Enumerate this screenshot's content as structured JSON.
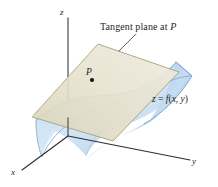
{
  "figure": {
    "background_color": "#ffffff"
  },
  "labels": {
    "z_axis": "z",
    "x_axis": "x",
    "y_axis": "y",
    "point": "P",
    "tangent_plane_text": "Tangent plane at ",
    "tangent_plane_point": "P",
    "surface_equation_lhs": "z",
    "surface_equation_eq": " = ",
    "surface_equation_fn": "f",
    "surface_equation_open": "(",
    "surface_equation_x": "x",
    "surface_equation_comma": ", ",
    "surface_equation_y": "y",
    "surface_equation_close": ")"
  },
  "colors": {
    "axis": "#6e6e72",
    "axis_dark": "#2f2f33",
    "plane_fill": "#e2ddc6",
    "plane_fill_light": "#efebdc",
    "plane_stroke": "#a39b7c",
    "surface_fill": "#c5dcef",
    "surface_fill_light": "#dfecf8",
    "surface_stroke": "#7fa9cf",
    "surface_edge": "#9cc3e0",
    "text": "#231f20",
    "leader_line": "#3a3a3e",
    "point_marker": "#141414"
  },
  "geometry": {
    "origin": {
      "x": 68,
      "y": 135
    },
    "z_axis_top": {
      "x": 68,
      "y": 18
    },
    "x_axis_end": {
      "x": 22,
      "y": 170
    },
    "y_axis_end": {
      "x": 190,
      "y": 160
    },
    "plane_corners": [
      {
        "x": 32,
        "y": 117
      },
      {
        "x": 98,
        "y": 44
      },
      {
        "x": 179,
        "y": 72
      },
      {
        "x": 113,
        "y": 141
      }
    ],
    "point_marker": {
      "x": 92,
      "y": 80,
      "r": 2.1
    },
    "leader_line": {
      "x1": 133,
      "y1": 35,
      "x2": 120,
      "y2": 50
    }
  }
}
